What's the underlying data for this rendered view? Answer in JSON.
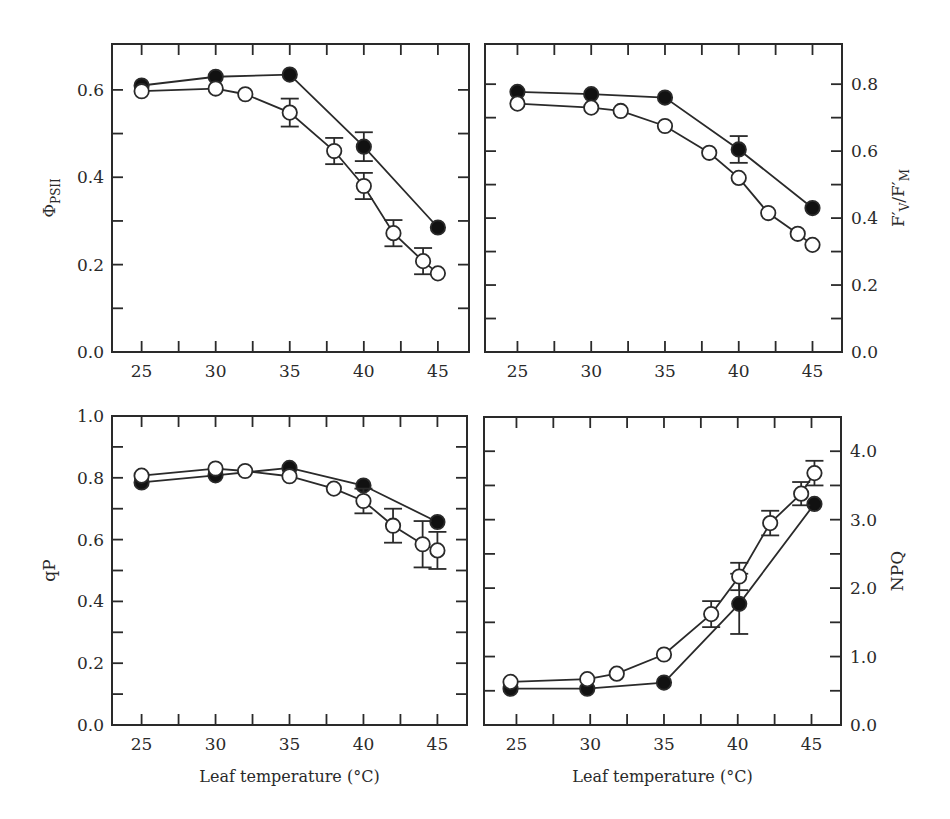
{
  "figure": {
    "style": {
      "axis_color": "#2a2a2a",
      "line_color": "#2a2a2a",
      "filled_marker_color": "#111111",
      "open_marker_fill": "#ffffff",
      "background": "#ffffff"
    },
    "legend": {
      "filled_circle": "series A (filled circles)",
      "open_circle": "series B (open circles)"
    }
  },
  "chart_data": [
    {
      "id": "phi-psii",
      "type": "line",
      "title": "",
      "xlabel": "",
      "ylabel": "ΦPSII",
      "ylabel_main": "Φ",
      "ylabel_sub": "PSII",
      "y_axis_side": "left",
      "xlim": [
        23,
        47.1
      ],
      "ylim": [
        0,
        0.705
      ],
      "x_ticks": [
        25,
        30,
        35,
        40,
        45
      ],
      "x_minor_ticks": [
        27.5,
        32.5,
        37.5,
        42.5
      ],
      "y_ticks": [
        0.0,
        0.2,
        0.4,
        0.6
      ],
      "y_tick_labels": [
        "0.0",
        "0.2",
        "0.4",
        "0.6"
      ],
      "y_minor_ticks": [
        0.1,
        0.3,
        0.5
      ],
      "grid": false,
      "panel_px": {
        "left": 112,
        "top": 44,
        "right": 469,
        "bottom": 352
      },
      "series": [
        {
          "name": "filled",
          "marker": "filled",
          "x": [
            25,
            30,
            35,
            40,
            45
          ],
          "y": [
            0.61,
            0.63,
            0.635,
            0.47,
            0.285
          ],
          "err": [
            0,
            0,
            0,
            0.033,
            0
          ]
        },
        {
          "name": "open",
          "marker": "open",
          "x": [
            25,
            30,
            32,
            35,
            38,
            40,
            42,
            44,
            45
          ],
          "y": [
            0.597,
            0.603,
            0.59,
            0.548,
            0.46,
            0.38,
            0.272,
            0.208,
            0.18
          ],
          "err": [
            0,
            0,
            0,
            0.032,
            0.03,
            0.03,
            0.03,
            0.03,
            0
          ]
        }
      ]
    },
    {
      "id": "fv-fm",
      "type": "line",
      "title": "",
      "xlabel": "",
      "ylabel": "F'V/F'M",
      "ylabel_main": "F′",
      "ylabel_sub": "V",
      "ylabel_main2": "/F′",
      "ylabel_sub2": "M",
      "y_axis_side": "right",
      "xlim": [
        22.8,
        47
      ],
      "ylim": [
        0,
        0.92
      ],
      "x_ticks": [
        25,
        30,
        35,
        40,
        45
      ],
      "x_minor_ticks": [
        27.5,
        32.5,
        37.5,
        42.5
      ],
      "y_ticks": [
        0.0,
        0.2,
        0.4,
        0.6,
        0.8
      ],
      "y_tick_labels": [
        "0.0",
        "0.2",
        "0.4",
        "0.6",
        "0.8"
      ],
      "y_minor_ticks": [
        0.1,
        0.3,
        0.5,
        0.7
      ],
      "grid": false,
      "panel_px": {
        "left": 485,
        "top": 44,
        "right": 842,
        "bottom": 352
      },
      "series": [
        {
          "name": "filled",
          "marker": "filled",
          "x": [
            25,
            30,
            35,
            40,
            45
          ],
          "y": [
            0.777,
            0.77,
            0.76,
            0.605,
            0.43
          ],
          "err": [
            0,
            0,
            0,
            0.04,
            0
          ]
        },
        {
          "name": "open",
          "marker": "open",
          "x": [
            25,
            30,
            32,
            35,
            38,
            40,
            42,
            44,
            45
          ],
          "y": [
            0.742,
            0.73,
            0.72,
            0.675,
            0.595,
            0.52,
            0.415,
            0.353,
            0.32
          ],
          "err": [
            0,
            0,
            0,
            0,
            0,
            0,
            0,
            0,
            0
          ]
        }
      ]
    },
    {
      "id": "qp",
      "type": "line",
      "title": "",
      "xlabel": "Leaf temperature (°C)",
      "ylabel": "qP",
      "y_axis_side": "left",
      "xlim": [
        23,
        47
      ],
      "ylim": [
        0,
        1.0
      ],
      "x_ticks": [
        25,
        30,
        35,
        40,
        45
      ],
      "x_minor_ticks": [
        27.5,
        32.5,
        37.5,
        42.5
      ],
      "y_ticks": [
        0.0,
        0.2,
        0.4,
        0.6,
        0.8,
        1.0
      ],
      "y_tick_labels": [
        "0.0",
        "0.2",
        "0.4",
        "0.6",
        "0.8",
        "1.0"
      ],
      "y_minor_ticks": [
        0.1,
        0.3,
        0.5,
        0.7,
        0.9
      ],
      "grid": false,
      "panel_px": {
        "left": 112,
        "top": 416,
        "right": 467,
        "bottom": 725
      },
      "series": [
        {
          "name": "filled",
          "marker": "filled",
          "x": [
            25,
            30,
            35,
            40,
            45
          ],
          "y": [
            0.785,
            0.808,
            0.832,
            0.775,
            0.657
          ],
          "err": [
            0,
            0,
            0,
            0,
            0
          ]
        },
        {
          "name": "open",
          "marker": "open",
          "x": [
            25,
            30,
            32,
            35,
            38,
            40,
            42,
            44,
            45
          ],
          "y": [
            0.807,
            0.83,
            0.822,
            0.805,
            0.765,
            0.725,
            0.645,
            0.585,
            0.565
          ],
          "err": [
            0,
            0,
            0,
            0,
            0,
            0.04,
            0.055,
            0.075,
            0.06
          ]
        }
      ]
    },
    {
      "id": "npq",
      "type": "line",
      "title": "",
      "xlabel": "Leaf temperature (°C)",
      "ylabel": "NPQ",
      "y_axis_side": "right",
      "xlim": [
        22.8,
        47
      ],
      "ylim": [
        0,
        4.5
      ],
      "x_ticks": [
        25,
        30,
        35,
        40,
        45
      ],
      "x_minor_ticks": [
        27.5,
        32.5,
        37.5,
        42.5
      ],
      "y_ticks": [
        0.0,
        1.0,
        2.0,
        3.0,
        4.0
      ],
      "y_tick_labels": [
        "0.0",
        "1.0",
        "2.0",
        "3.0",
        "4.0"
      ],
      "y_minor_ticks": [
        0.5,
        1.5,
        2.5,
        3.5
      ],
      "grid": false,
      "panel_px": {
        "left": 484,
        "top": 417,
        "right": 841,
        "bottom": 725
      },
      "series": [
        {
          "name": "filled",
          "marker": "filled",
          "x": [
            24.6,
            29.8,
            35,
            40.1,
            45.2
          ],
          "y": [
            0.53,
            0.53,
            0.62,
            1.77,
            3.23
          ],
          "err": [
            0,
            0,
            0,
            0.44,
            0
          ]
        },
        {
          "name": "open",
          "marker": "open",
          "x": [
            24.6,
            29.8,
            31.8,
            35,
            38.2,
            40.1,
            42.2,
            44.3,
            45.2
          ],
          "y": [
            0.63,
            0.67,
            0.75,
            1.03,
            1.62,
            2.17,
            2.95,
            3.38,
            3.68
          ],
          "err": [
            0,
            0,
            0,
            0,
            0.19,
            0.2,
            0.18,
            0.17,
            0.18
          ]
        }
      ]
    }
  ]
}
